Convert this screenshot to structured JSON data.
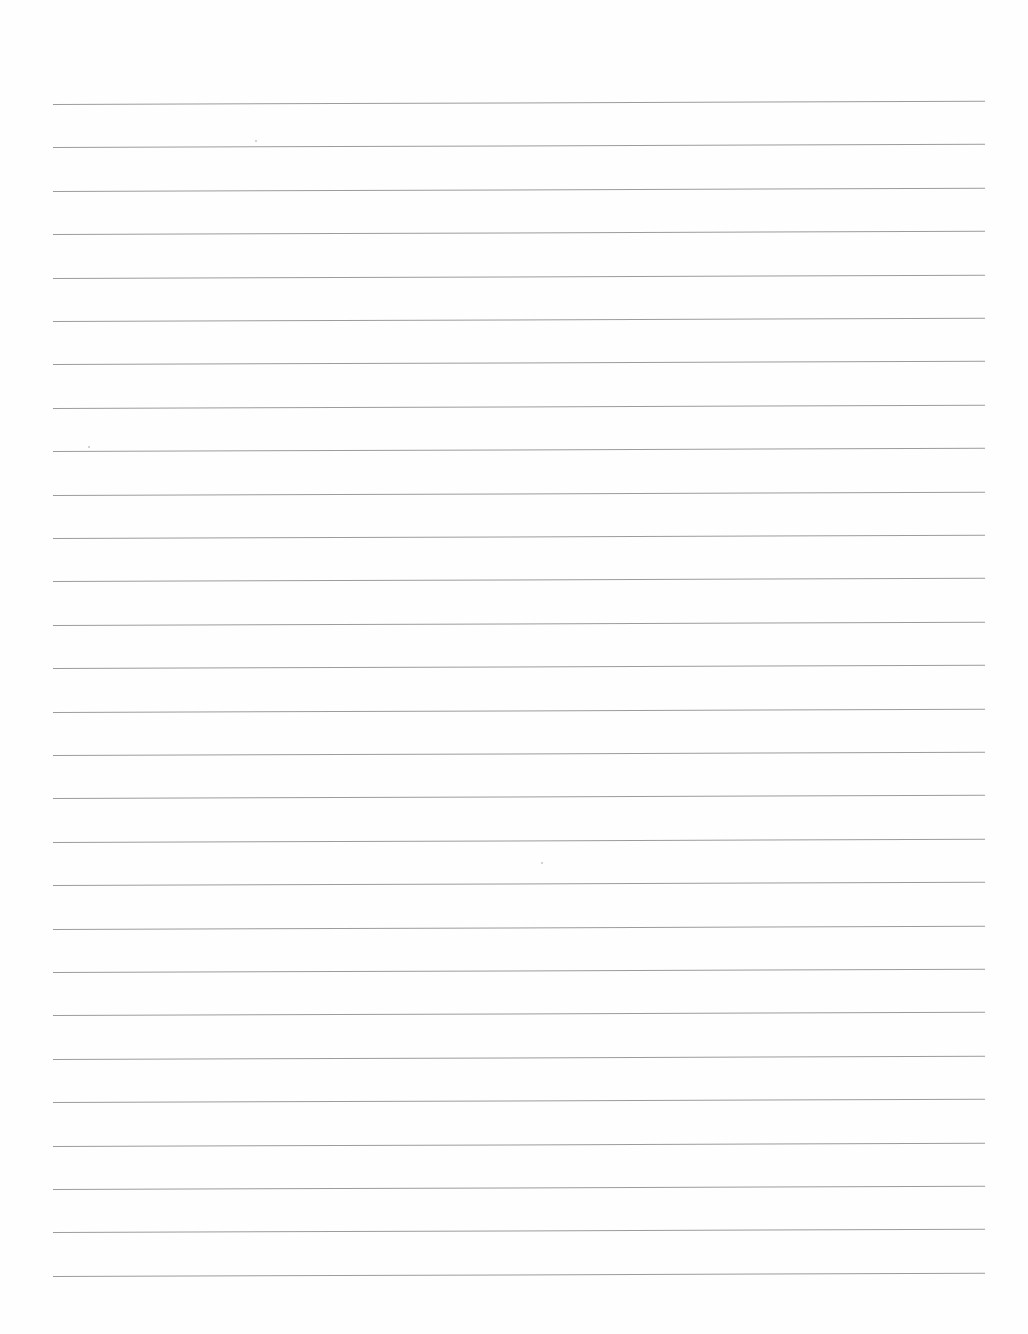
{
  "page": {
    "type": "blank-lined-paper",
    "background_color": "#fefefe",
    "line_color": "#9c9c9c",
    "line_count": 28,
    "line_left_x": 53,
    "line_right_x": 985,
    "first_line_y": 104,
    "line_spacing": 43.4,
    "skew_deg": -0.2,
    "text_content": []
  }
}
